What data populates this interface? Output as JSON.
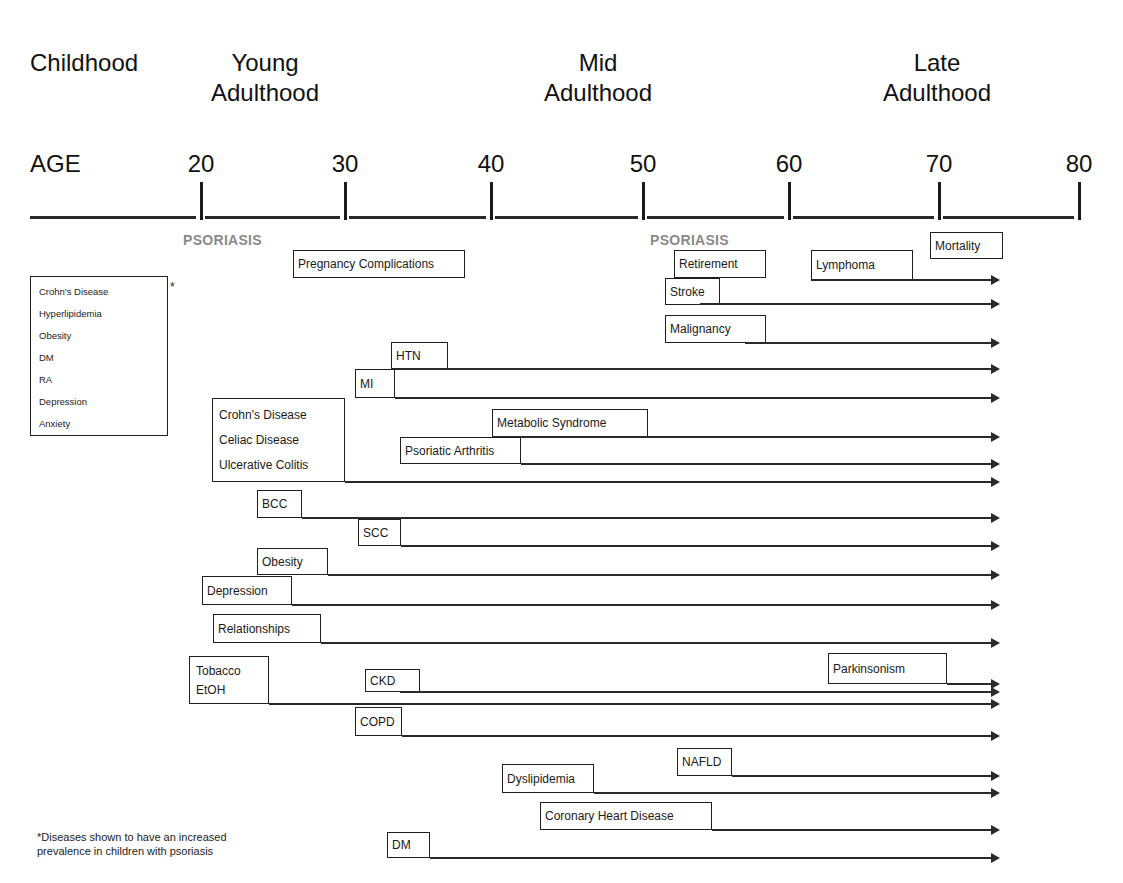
{
  "stages": [
    {
      "label": "Childhood",
      "x": 30,
      "y": 48
    },
    {
      "label": "Young\nAdulthood",
      "x": 245,
      "y": 48,
      "lines": [
        "Young",
        "Adulthood"
      ]
    },
    {
      "label": "Mid\nAdulthood",
      "x": 578,
      "y": 48,
      "lines": [
        "Mid",
        "Adulthood"
      ]
    },
    {
      "label": "Late\nAdulthood",
      "x": 917,
      "y": 48,
      "lines": [
        "Late",
        "Adulthood"
      ]
    }
  ],
  "axis": {
    "label": "AGE",
    "ticks": [
      {
        "value": "20",
        "x": 201
      },
      {
        "value": "30",
        "x": 345
      },
      {
        "value": "40",
        "x": 491
      },
      {
        "value": "50",
        "x": 643
      },
      {
        "value": "60",
        "x": 789
      },
      {
        "value": "70",
        "x": 939
      },
      {
        "value": "80",
        "x": 1079
      }
    ]
  },
  "psoriasis_markers": [
    {
      "label": "PSORIASIS",
      "x": 183,
      "y": 232
    },
    {
      "label": "PSORIASIS",
      "x": 650,
      "y": 232
    }
  ],
  "childhood_legend": {
    "items": [
      "Crohn's Disease",
      "Hyperlipidemia",
      "Obesity",
      "DM",
      "RA",
      "Depression",
      "Anxiety"
    ],
    "marker": "*"
  },
  "events": [
    {
      "id": "mortality",
      "label": "Mortality",
      "box": [
        930,
        232,
        73,
        27
      ],
      "arrow": null
    },
    {
      "id": "pregnancy",
      "label": "Pregnancy Complications",
      "box": [
        293,
        250,
        172,
        28
      ],
      "arrow": null
    },
    {
      "id": "retirement",
      "label": "Retirement",
      "box": [
        674,
        250,
        92,
        28
      ],
      "arrow": null
    },
    {
      "id": "lymphoma",
      "label": "Lymphoma",
      "box": [
        811,
        250,
        102,
        30
      ],
      "arrow": [
        811,
        280
      ]
    },
    {
      "id": "stroke",
      "label": "Stroke",
      "box": [
        665,
        278,
        55,
        27
      ],
      "arrow": [
        700,
        304
      ]
    },
    {
      "id": "malignancy",
      "label": "Malignancy",
      "box": [
        665,
        315,
        101,
        28
      ],
      "arrow": [
        745,
        343
      ]
    },
    {
      "id": "htn",
      "label": "HTN",
      "box": [
        391,
        342,
        57,
        27
      ],
      "arrow": [
        391,
        369
      ]
    },
    {
      "id": "mi",
      "label": "MI",
      "box": [
        355,
        369,
        40,
        29
      ],
      "arrow": [
        395,
        398
      ]
    },
    {
      "id": "metabolic",
      "label": "Metabolic Syndrome",
      "box": [
        492,
        409,
        156,
        28
      ],
      "arrow": [
        492,
        437
      ]
    },
    {
      "id": "psoriatic_arthritis",
      "label": "Psoriatic Arthritis",
      "box": [
        400,
        437,
        121,
        27
      ],
      "arrow": [
        521,
        464
      ]
    },
    {
      "id": "bcc",
      "label": "BCC",
      "box": [
        257,
        490,
        45,
        28
      ],
      "arrow": [
        302,
        518
      ]
    },
    {
      "id": "scc",
      "label": "SCC",
      "box": [
        358,
        519,
        43,
        27
      ],
      "arrow": [
        401,
        546
      ]
    },
    {
      "id": "obesity",
      "label": "Obesity",
      "box": [
        257,
        548,
        71,
        27
      ],
      "arrow": [
        328,
        575
      ]
    },
    {
      "id": "depression",
      "label": "Depression",
      "box": [
        202,
        576,
        90,
        29
      ],
      "arrow": [
        292,
        605
      ]
    },
    {
      "id": "relationships",
      "label": "Relationships",
      "box": [
        213,
        614,
        108,
        29
      ],
      "arrow": [
        321,
        643
      ]
    },
    {
      "id": "parkinsonism",
      "label": "Parkinsonism",
      "box": [
        828,
        653,
        119,
        31
      ],
      "arrow": [
        947,
        684
      ]
    },
    {
      "id": "ckd",
      "label": "CKD",
      "box": [
        365,
        669,
        55,
        23
      ],
      "arrow": [
        400,
        692
      ]
    },
    {
      "id": "copd",
      "label": "COPD",
      "box": [
        355,
        707,
        47,
        29
      ],
      "arrow": [
        402,
        736
      ]
    },
    {
      "id": "nafld",
      "label": "NAFLD",
      "box": [
        677,
        748,
        55,
        28
      ],
      "arrow": [
        732,
        776
      ]
    },
    {
      "id": "dyslipidemia",
      "label": "Dyslipidemia",
      "box": [
        502,
        764,
        92,
        29
      ],
      "arrow": [
        594,
        793
      ]
    },
    {
      "id": "chd",
      "label": "Coronary Heart Disease",
      "box": [
        540,
        802,
        172,
        28
      ],
      "arrow": [
        712,
        830
      ]
    },
    {
      "id": "dm",
      "label": "DM",
      "box": [
        387,
        832,
        43,
        26
      ],
      "arrow": [
        430,
        858
      ]
    }
  ],
  "group_boxes": [
    {
      "id": "ibd_group",
      "items": [
        "Crohn's Disease",
        "Celiac Disease",
        "Ulcerative Colitis"
      ],
      "box": [
        212,
        398,
        133,
        84
      ],
      "arrow": [
        345,
        482
      ]
    },
    {
      "id": "substance_group",
      "items": [
        "Tobacco",
        "EtOH"
      ],
      "box": [
        189,
        656,
        80,
        48
      ],
      "arrow": [
        269,
        704
      ]
    }
  ],
  "arrow_end_x": 1000,
  "footnote": {
    "lines": [
      "*Diseases shown to have an increased",
      "prevalence in children with psoriasis"
    ]
  }
}
